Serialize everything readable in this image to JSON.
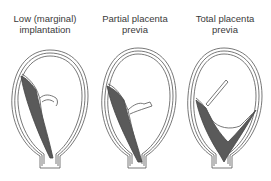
{
  "figure": {
    "panels": [
      {
        "id": "low-marginal",
        "title_line1": "Low (marginal)",
        "title_line2": "implantation"
      },
      {
        "id": "partial",
        "title_line1": "Partial placenta",
        "title_line2": "previa"
      },
      {
        "id": "total",
        "title_line1": "Total placenta",
        "title_line2": "previa"
      }
    ],
    "colors": {
      "outline": "#555555",
      "placenta": "#5a5a5a",
      "background": "#ffffff"
    }
  }
}
